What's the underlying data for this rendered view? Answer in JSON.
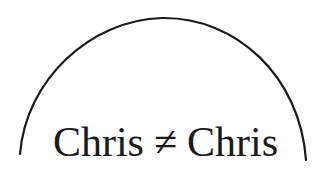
{
  "diagram": {
    "shape": "semicircular-arc",
    "stroke_color": "#1a1a1a",
    "background": "#ffffff",
    "label": {
      "left": "Chris",
      "operator": "≠",
      "right": "Chris"
    }
  }
}
